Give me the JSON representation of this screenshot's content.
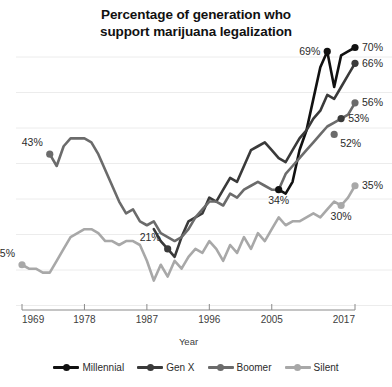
{
  "chart_data": {
    "type": "line",
    "title": "Percentage of generation who\nsupport marijuana legalization",
    "xlabel": "Year",
    "ylabel": "",
    "xlim": [
      1969,
      2017
    ],
    "ylim": [
      0,
      75
    ],
    "xticks": [
      "1969",
      "1978",
      "1987",
      "1996",
      "2005",
      "2017"
    ],
    "xtick_values": [
      1969,
      1978,
      1987,
      1996,
      2005,
      2017
    ],
    "grid": "horizontal",
    "legend_position": "bottom",
    "colors": {
      "millennial": "#111111",
      "genx": "#3a3a3a",
      "boomer": "#6b6b6b",
      "silent": "#a8a8a8"
    },
    "series": [
      {
        "name": "Millennial",
        "color": "#111111",
        "x": [
          2006,
          2007,
          2008,
          2009,
          2010,
          2011,
          2012,
          2013,
          2014,
          2015,
          2016,
          2017
        ],
        "values": [
          34,
          33,
          36,
          44,
          49,
          57,
          65,
          69,
          60,
          68,
          69,
          70
        ],
        "start_label": "34%",
        "end_label": "70%"
      },
      {
        "name": "Gen X",
        "color": "#3a3a3a",
        "x": [
          1988,
          1989,
          1990,
          1991,
          1992,
          1993,
          1994,
          1995,
          1996,
          1997,
          1998,
          1999,
          2000,
          2001,
          2002,
          2003,
          2004,
          2005,
          2006,
          2007,
          2008,
          2009,
          2010,
          2011,
          2012,
          2013,
          2014,
          2015,
          2016,
          2017
        ],
        "values": [
          24,
          21,
          19,
          17,
          22,
          26,
          27,
          28,
          32,
          31,
          34,
          37,
          36,
          40,
          44,
          45,
          46,
          44,
          42,
          41,
          44,
          47,
          49,
          52,
          54,
          58,
          57,
          60,
          63,
          66
        ],
        "start_label": "21%",
        "end_label": "66%"
      },
      {
        "name": "Boomer",
        "color": "#6b6b6b",
        "x": [
          1973,
          1974,
          1975,
          1976,
          1977,
          1978,
          1979,
          1980,
          1981,
          1982,
          1983,
          1984,
          1985,
          1986,
          1987,
          1988,
          1989,
          1990,
          1991,
          1992,
          1993,
          1994,
          1995,
          1996,
          1997,
          1998,
          1999,
          2000,
          2001,
          2002,
          2003,
          2004,
          2005,
          2006,
          2007,
          2008,
          2009,
          2010,
          2011,
          2012,
          2013,
          2014,
          2015,
          2016,
          2017
        ],
        "values": [
          43,
          40,
          45,
          47,
          47,
          47,
          46,
          43,
          39,
          35,
          31,
          28,
          29,
          26,
          25,
          26,
          23,
          22,
          21,
          22,
          24,
          27,
          29,
          31,
          31,
          30,
          33,
          32,
          34,
          35,
          36,
          35,
          34,
          34,
          38,
          40,
          42,
          44,
          46,
          48,
          50,
          51,
          52,
          53,
          56
        ],
        "start_label": "43%",
        "mid_labels": [
          "21%",
          "52%",
          "53%"
        ],
        "end_label": "56%"
      },
      {
        "name": "Silent",
        "color": "#a8a8a8",
        "x": [
          1969,
          1970,
          1971,
          1972,
          1973,
          1974,
          1975,
          1976,
          1977,
          1978,
          1979,
          1980,
          1981,
          1982,
          1983,
          1984,
          1985,
          1986,
          1987,
          1988,
          1989,
          1990,
          1991,
          1992,
          1993,
          1994,
          1995,
          1996,
          1997,
          1998,
          1999,
          2000,
          2001,
          2002,
          2003,
          2004,
          2005,
          2006,
          2007,
          2008,
          2009,
          2010,
          2011,
          2012,
          2013,
          2014,
          2015,
          2016,
          2017
        ],
        "values": [
          15,
          14,
          14,
          13,
          13,
          16,
          19,
          22,
          23,
          24,
          24,
          23,
          21,
          21,
          20,
          21,
          21,
          20,
          16,
          11,
          15,
          12,
          16,
          14,
          17,
          19,
          18,
          21,
          19,
          16,
          20,
          18,
          22,
          19,
          23,
          21,
          24,
          27,
          25,
          26,
          26,
          27,
          28,
          27,
          29,
          31,
          30,
          32,
          35
        ],
        "start_label": "15%",
        "mid_labels": [
          "30%"
        ],
        "end_label": "35%"
      }
    ],
    "annotations": [
      {
        "text": "15%",
        "x": 1969,
        "y": 15,
        "series": "Silent",
        "placement": "above-left"
      },
      {
        "text": "43%",
        "x": 1973,
        "y": 43,
        "series": "Boomer",
        "placement": "above-left"
      },
      {
        "text": "21%",
        "x": 1990,
        "y": 19,
        "series": "Gen X",
        "placement": "above-left"
      },
      {
        "text": "34%",
        "x": 2006,
        "y": 34,
        "series": "Millennial",
        "placement": "below"
      },
      {
        "text": "69%",
        "x": 2013,
        "y": 69,
        "series": "Millennial",
        "placement": "left"
      },
      {
        "text": "70%",
        "x": 2017,
        "y": 70,
        "series": "Millennial",
        "placement": "right"
      },
      {
        "text": "66%",
        "x": 2017,
        "y": 66,
        "series": "Gen X",
        "placement": "right"
      },
      {
        "text": "56%",
        "x": 2017,
        "y": 56,
        "series": "Boomer",
        "placement": "right"
      },
      {
        "text": "53%",
        "x": 2015,
        "y": 52,
        "series": "Gen X",
        "placement": "right"
      },
      {
        "text": "52%",
        "x": 2014,
        "y": 48,
        "series": "Boomer",
        "placement": "below-right"
      },
      {
        "text": "30%",
        "x": 2015,
        "y": 30,
        "series": "Silent",
        "placement": "below"
      },
      {
        "text": "35%",
        "x": 2017,
        "y": 35,
        "series": "Silent",
        "placement": "right"
      }
    ]
  },
  "legend": {
    "items": [
      {
        "label": "Millennial",
        "color": "#111111"
      },
      {
        "label": "Gen X",
        "color": "#3a3a3a"
      },
      {
        "label": "Boomer",
        "color": "#6b6b6b"
      },
      {
        "label": "Silent",
        "color": "#a8a8a8"
      }
    ]
  }
}
